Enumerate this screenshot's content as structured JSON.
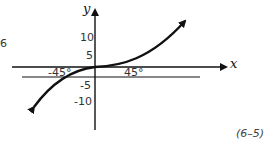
{
  "diagram": {
    "type": "function-graph",
    "axes": {
      "x_label": "x",
      "y_label": "y",
      "y_ticks": [
        "10",
        "5",
        "-5",
        "-10"
      ]
    },
    "angle_labels": {
      "left": "-45°",
      "right": "45°"
    },
    "side_marker": "6",
    "equation_number": "(6–5)",
    "curve": "cubic-like S curve passing through origin, flattened near origin"
  }
}
